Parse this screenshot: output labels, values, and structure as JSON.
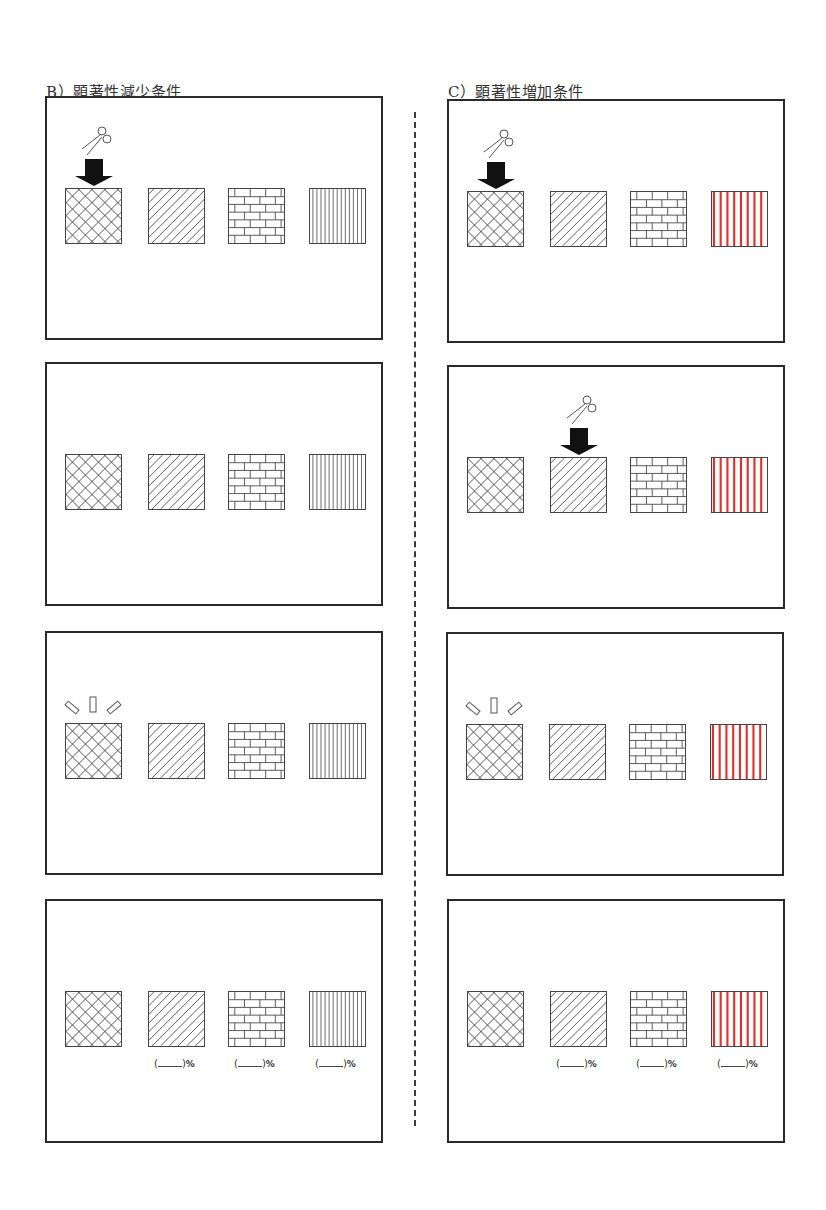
{
  "columns": [
    {
      "id": "B",
      "title": "B）顕著性減少条件",
      "stripe_color": "#444444",
      "panels": [
        {
          "step": 1,
          "cue": "scissors-arrow",
          "cue_target": 0,
          "show_percent": false
        },
        {
          "step": 2,
          "cue": "none",
          "cue_target": null,
          "show_percent": false
        },
        {
          "step": 3,
          "cue": "highlight",
          "cue_target": 0,
          "show_percent": false
        },
        {
          "step": 4,
          "cue": "none",
          "cue_target": null,
          "show_percent": true
        }
      ]
    },
    {
      "id": "C",
      "title": "C）顕著性増加条件",
      "stripe_color": "#e0302a",
      "panels": [
        {
          "step": 1,
          "cue": "scissors-arrow",
          "cue_target": 0,
          "show_percent": false
        },
        {
          "step": 2,
          "cue": "scissors-arrow",
          "cue_target": 1,
          "show_percent": false
        },
        {
          "step": 3,
          "cue": "highlight",
          "cue_target": 0,
          "show_percent": false
        },
        {
          "step": 4,
          "cue": "none",
          "cue_target": null,
          "show_percent": true
        }
      ]
    }
  ],
  "patterns": [
    "crosshatch",
    "diagonal-lines",
    "brick",
    "vertical-stripes"
  ],
  "percent_label": {
    "open": "(",
    "close": ")",
    "symbol": "%"
  },
  "colors": {
    "border": "#2a2a2a",
    "pattern_line": "#444444",
    "salient_red": "#e0302a",
    "arrow": "#111111"
  }
}
